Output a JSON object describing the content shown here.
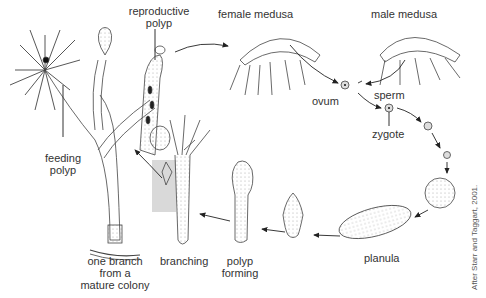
{
  "diagram": {
    "labels": {
      "reproductive_polyp_line1": "reproductive",
      "reproductive_polyp_line2": "polyp",
      "female_medusa": "female medusa",
      "male_medusa": "male medusa",
      "ovum": "ovum",
      "sperm": "sperm",
      "zygote": "zygote",
      "feeding_polyp_line1": "feeding",
      "feeding_polyp_line2": "polyp",
      "planula": "planula",
      "polyp_forming_line1": "polyp",
      "polyp_forming_line2": "forming",
      "branching": "branching",
      "colony_line1": "one branch",
      "colony_line2": "from a",
      "colony_line3": "mature colony"
    },
    "credit": "After Starr and Taggart, 2001.",
    "colors": {
      "line": "#333333",
      "highlight_box": "#d9d9d9",
      "stipple": "#999999"
    }
  }
}
